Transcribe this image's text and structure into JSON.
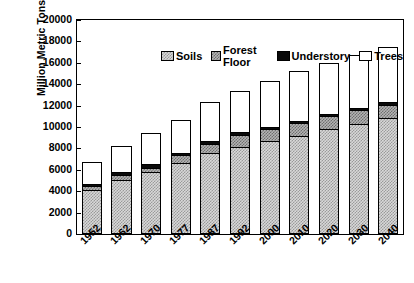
{
  "chart_data": {
    "type": "bar",
    "subtype": "stacked-vertical",
    "title": "",
    "xlabel": "",
    "ylabel": "Million Metric Tons",
    "ylim": [
      0,
      20000
    ],
    "ytick_step": 2000,
    "yticks": [
      0,
      2000,
      4000,
      6000,
      8000,
      10000,
      12000,
      14000,
      16000,
      18000,
      20000
    ],
    "grid": false,
    "legend_position": "top-inside",
    "categories": [
      "1952",
      "1962",
      "1970",
      "1977",
      "1987",
      "1992",
      "2000",
      "2010",
      "2020",
      "2030",
      "2040"
    ],
    "series": [
      {
        "name": "Soils",
        "color": "#d8d8d8",
        "pattern": "light-stipple",
        "values": [
          4150,
          5050,
          5800,
          6600,
          7550,
          8150,
          8650,
          9200,
          9800,
          10250,
          10800
        ]
      },
      {
        "name": "Forest Floor",
        "color": "#b4b4b4",
        "pattern": "medium-stipple",
        "values": [
          300,
          450,
          400,
          750,
          850,
          1150,
          1150,
          1200,
          1250,
          1350,
          1300
        ]
      },
      {
        "name": "Understory",
        "color": "#0a0a0a",
        "pattern": "solid-black",
        "values": [
          250,
          300,
          300,
          200,
          250,
          200,
          200,
          200,
          200,
          200,
          250
        ]
      },
      {
        "name": "Trees",
        "color": "#ffffff",
        "pattern": "white",
        "values": [
          2000,
          2400,
          2900,
          3150,
          3650,
          3900,
          4300,
          4600,
          4750,
          4900,
          5150
        ]
      }
    ],
    "totals": [
      6700,
      8200,
      9400,
      10700,
      12300,
      13400,
      14300,
      15200,
      16000,
      16700,
      17500
    ]
  }
}
